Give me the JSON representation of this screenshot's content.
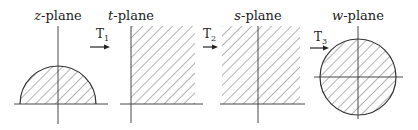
{
  "diagram": {
    "planes": [
      {
        "id": "z",
        "var": "z",
        "suffix": "-plane",
        "region": "upper half-disk"
      },
      {
        "id": "t",
        "var": "t",
        "suffix": "-plane",
        "region": "first quadrant"
      },
      {
        "id": "s",
        "var": "s",
        "suffix": "-plane",
        "region": "upper half-plane"
      },
      {
        "id": "w",
        "var": "w",
        "suffix": "-plane",
        "region": "unit disk"
      }
    ],
    "transforms": [
      {
        "letter": "T",
        "sub": "1"
      },
      {
        "letter": "T",
        "sub": "2"
      },
      {
        "letter": "T",
        "sub": "3"
      }
    ]
  }
}
